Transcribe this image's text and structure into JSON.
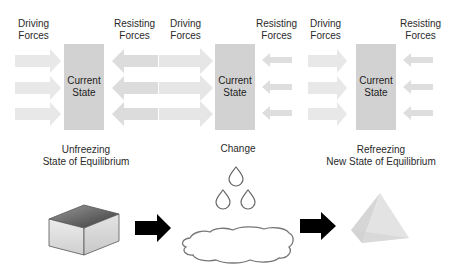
{
  "panels": [
    {
      "driving_label": [
        "Driving",
        "Forces"
      ],
      "resisting_label": [
        "Resisting",
        "Forces"
      ],
      "box_label": [
        "Current",
        "State"
      ],
      "stage_label": [
        "Unfreezing",
        "State of Equilibrium"
      ]
    },
    {
      "driving_label": [
        "Driving",
        "Forces"
      ],
      "resisting_label": [
        "Resisting",
        "Forces"
      ],
      "box_label": [
        "Current",
        "State"
      ],
      "stage_label": [
        "Change"
      ]
    },
    {
      "driving_label": [
        "Driving",
        "Forces"
      ],
      "resisting_label": [
        "Resisting",
        "Forces"
      ],
      "box_label": [
        "Current",
        "State"
      ],
      "stage_label": [
        "Refreezing",
        "New State of Equilibrium"
      ]
    }
  ],
  "illustrations": {
    "stage1_shape": "cube-icon",
    "stage2_shape": "water-droplets-and-puddle-icon",
    "stage3_shape": "pyramid-icon",
    "transition_arrow": "right-arrow-icon"
  },
  "colors": {
    "state_box": "#d2d2d2",
    "force_arrow": "#e6e6e6",
    "transition_arrow": "#000000",
    "text": "#2a2a2a"
  }
}
